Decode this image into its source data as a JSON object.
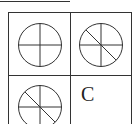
{
  "figure": {
    "cells": [
      {
        "position": "top-left",
        "shape": "circle-with-cross",
        "lines": [
          "vertical",
          "horizontal"
        ]
      },
      {
        "position": "top-right",
        "shape": "circle-with-cross-and-diagonal",
        "lines": [
          "vertical",
          "horizontal",
          "diagonal-tl-br"
        ]
      },
      {
        "position": "bottom-left",
        "shape": "circle-with-cross-and-diagonal",
        "lines": [
          "vertical",
          "horizontal",
          "diagonal-tl-br"
        ]
      },
      {
        "position": "bottom-right",
        "label": "C"
      }
    ],
    "answer_label": "C",
    "line_color": "#333333",
    "background": "#ffffff"
  }
}
